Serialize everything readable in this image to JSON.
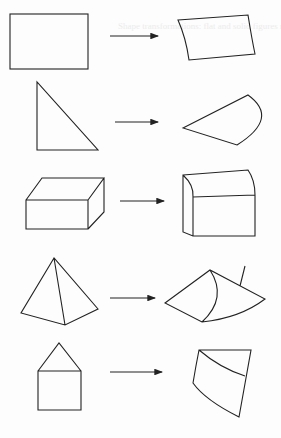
{
  "diagram": {
    "title": "Shape transformations: flat and solid figures mapped to curved counterparts",
    "rows": [
      {
        "from": "rectangle",
        "to": "curved-quadrilateral"
      },
      {
        "from": "right-triangle",
        "to": "circular-sector"
      },
      {
        "from": "rectangular-prism",
        "to": "curved-top-box"
      },
      {
        "from": "triangular-pyramid",
        "to": "cone-section"
      },
      {
        "from": "pentagon-house",
        "to": "curved-cylinder-segment"
      }
    ],
    "arrow_label": "→",
    "stroke_color": "#222222",
    "background_color": "#fdfdfd"
  }
}
